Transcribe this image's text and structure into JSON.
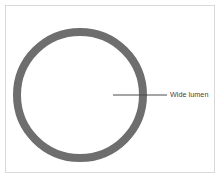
{
  "figure": {
    "canvas": {
      "width": 221,
      "height": 181,
      "background_color": "#ffffff"
    },
    "frame": {
      "border_color": "#d9d9d9",
      "border_width": 1,
      "inset": 5
    },
    "shape": {
      "name": "annulus",
      "description": "Cross-section of a vessel drawn as a thick gray ring with a large open interior",
      "fill_color": "#6e6e6e",
      "center_x": 80,
      "center_y": 95,
      "outer_radius": 67,
      "wall_thickness": 8
    },
    "callout": {
      "label": "Wide lumen",
      "text_color": "#3f3f3f",
      "leader_color": "#4a4a4a",
      "leader_x_start": 113,
      "leader_x_end": 167,
      "leader_y": 95,
      "leader_width": 1
    }
  }
}
